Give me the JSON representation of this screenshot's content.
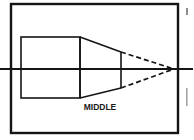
{
  "figure": {
    "kind": "engineering-line-drawing",
    "background_color": "#ffffff",
    "line_color": "#151515",
    "frame": {
      "name": "page-border",
      "x": 11,
      "y": 4,
      "width": 167,
      "height": 129,
      "stroke_width": 2.4
    },
    "body_rectangle": {
      "name": "cylindrical-body-outline",
      "x": 21,
      "y": 37,
      "width": 59,
      "height": 61,
      "stroke_width": 1.6
    },
    "taper": {
      "name": "conical-taper-outline",
      "base_x": 80,
      "base_top_y": 37,
      "base_bottom_y": 98,
      "tip_x": 121,
      "tip_top_y": 52,
      "tip_bottom_y": 88,
      "stroke_width": 1.6
    },
    "center_line": {
      "name": "axis-center-line",
      "x1": 0,
      "y1": 69,
      "x2": 193,
      "y2": 69,
      "stroke_width": 2.0
    },
    "projection_lines": [
      {
        "name": "upper-projection-line",
        "x1": 121,
        "y1": 52,
        "x2": 174,
        "y2": 69,
        "dash": "5 3",
        "stroke_width": 1.7
      },
      {
        "name": "lower-projection-line",
        "x1": 121,
        "y1": 88,
        "x2": 174,
        "y2": 69,
        "dash": "5 3",
        "stroke_width": 1.7
      }
    ],
    "apex": {
      "name": "cone-apex-point",
      "x": 174,
      "y": 69
    },
    "labels": [
      {
        "name": "middle-label",
        "text": "MIDDLE",
        "x": 100,
        "y": 110,
        "font_size": 8.5,
        "anchor": "middle"
      }
    ],
    "edge_artifacts": [
      {
        "name": "page-bleed-mark-top-right",
        "x": 186,
        "y": 8,
        "width": 2,
        "height": 7,
        "color": "#8d8d8d"
      },
      {
        "name": "page-bleed-mark-mid-right",
        "x": 186,
        "y": 88,
        "width": 1.6,
        "height": 18,
        "color": "#a5a5a5"
      }
    ]
  }
}
